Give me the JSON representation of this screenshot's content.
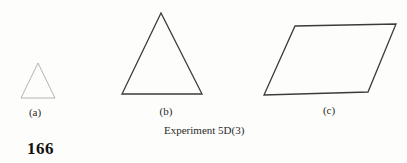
{
  "figure": {
    "caption": "Experiment 5D(3)",
    "page_number": "166",
    "shapes": {
      "a": {
        "label": "(a)",
        "type": "small-triangle",
        "points": "38,63 21,98 55,98",
        "stroke": "#b4b4b4"
      },
      "b": {
        "label": "(b)",
        "type": "large-triangle",
        "points": "161,13 122,94 202,94",
        "stroke": "#3b3b3b"
      },
      "c": {
        "label": "(c)",
        "type": "parallelogram",
        "points": "295,26 396,24 368,92 264,95",
        "stroke": "#3b3b3b"
      }
    },
    "colors": {
      "background": "#fdfdfb",
      "text": "#1c1c1c"
    }
  }
}
